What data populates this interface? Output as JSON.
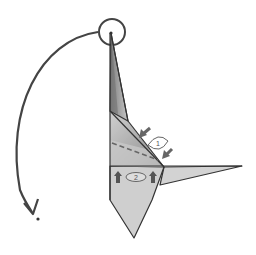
{
  "diagram": {
    "type": "origami-folding-instruction",
    "colors": {
      "background": "#ffffff",
      "outline": "#333333",
      "paper_light": "#d6d6d6",
      "paper_mid": "#bdbdbd",
      "paper_dark": "#8a8a8a",
      "arrow": "#555555",
      "dashed_line": "#777777"
    },
    "steps": [
      {
        "number": "1",
        "description": "pinch/press inward arrows toward diagonal edge"
      },
      {
        "number": "2",
        "description": "push upward arrows"
      }
    ],
    "annotations": {
      "circle_highlight": "tip circled at top",
      "curved_arrow": "rotate tip down to the left"
    }
  }
}
